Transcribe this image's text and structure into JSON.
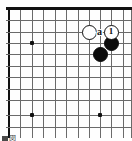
{
  "figure": {
    "kind": "go-board-diagram",
    "caption": "図",
    "board": {
      "size": 19,
      "visible_columns": 11,
      "visible_rows": 12,
      "cell_px": 11.3,
      "origin_x": 9,
      "origin_y": 9,
      "line_color": "#6a6a6a",
      "edge_color": "#111111",
      "background": "#fefefe"
    },
    "star_points": [
      {
        "col": 3,
        "row": 4,
        "x": 32,
        "y": 43
      },
      {
        "col": 3,
        "row": 10,
        "x": 32,
        "y": 115
      },
      {
        "col": 9,
        "row": 10,
        "x": 100,
        "y": 115
      }
    ],
    "stones": [
      {
        "id": "white-stone-left",
        "color": "white",
        "label": "",
        "x": 89,
        "y": 32,
        "d": 15
      },
      {
        "id": "white-stone-move-1",
        "color": "white",
        "label": "1",
        "x": 111,
        "y": 32,
        "d": 15,
        "circled": true
      },
      {
        "id": "black-stone-right",
        "color": "black",
        "label": "",
        "x": 111,
        "y": 43,
        "d": 15
      },
      {
        "id": "black-stone-lower",
        "color": "black",
        "label": "",
        "x": 100,
        "y": 54,
        "d": 15
      }
    ],
    "point_markers": [
      {
        "id": "point-a",
        "label": "a",
        "x": 100,
        "y": 32
      }
    ],
    "colors": {
      "black_stone": "#0b0b0b",
      "white_stone": "#ffffff",
      "stone_outline": "#111111",
      "grid": "#6a6a6a",
      "border": "#111111"
    }
  }
}
